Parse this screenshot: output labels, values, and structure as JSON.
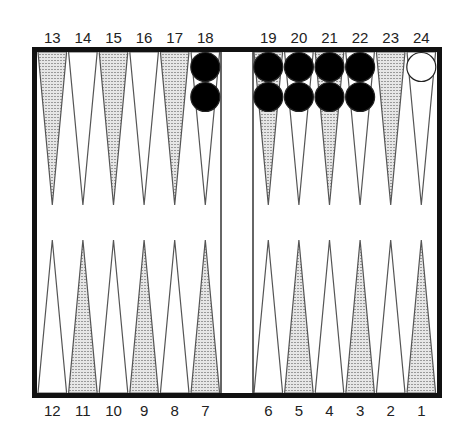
{
  "board": {
    "top_labels": [
      "13",
      "14",
      "15",
      "16",
      "17",
      "18",
      "19",
      "20",
      "21",
      "22",
      "23",
      "24"
    ],
    "bottom_labels": [
      "12",
      "11",
      "10",
      "9",
      "8",
      "7",
      "6",
      "5",
      "4",
      "3",
      "2",
      "1"
    ],
    "shaded_points": [
      13,
      15,
      17,
      19,
      21,
      23,
      11,
      9,
      7,
      5,
      3,
      1
    ],
    "colors": {
      "frame": "#111111",
      "point_line": "#555555",
      "shade": "#c8c8c8",
      "black_checker": "#000000",
      "white_checker": "#ffffff"
    }
  },
  "checkers": [
    {
      "point": 18,
      "color": "black",
      "count": 2
    },
    {
      "point": 19,
      "color": "black",
      "count": 2
    },
    {
      "point": 20,
      "color": "black",
      "count": 2
    },
    {
      "point": 21,
      "color": "black",
      "count": 2
    },
    {
      "point": 22,
      "color": "black",
      "count": 2
    },
    {
      "point": 24,
      "color": "white",
      "count": 1
    }
  ]
}
